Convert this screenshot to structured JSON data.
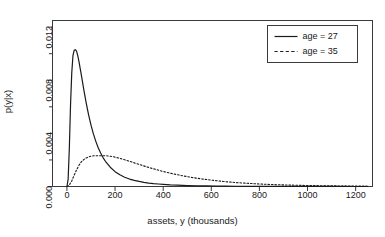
{
  "chart_data": {
    "type": "line",
    "title": "",
    "xlabel": "assets, y (thousands)",
    "ylabel": "p(y|x)",
    "xlim": [
      -60,
      1270
    ],
    "ylim": [
      0.0,
      0.0125
    ],
    "grid": false,
    "legend_position": "top-right",
    "xticks": [
      0,
      200,
      400,
      600,
      800,
      1000,
      1200
    ],
    "xtick_labels": [
      "0",
      "200",
      "400",
      "600",
      "800",
      "1000",
      "1200"
    ],
    "yticks": [
      0.0,
      0.004,
      0.008,
      0.012
    ],
    "ytick_labels": [
      "0.000",
      "0.004",
      "0.008",
      "0.012"
    ],
    "yminor_ticks": [
      0.002,
      0.006,
      0.01
    ],
    "series": [
      {
        "name": "age = 27",
        "style": "solid",
        "color": "#1a1a1a",
        "peak_x": 40,
        "peak_y": 0.0103,
        "x": [
          0,
          5,
          10,
          15,
          20,
          25,
          30,
          35,
          40,
          45,
          50,
          60,
          70,
          80,
          90,
          100,
          110,
          120,
          130,
          140,
          150,
          160,
          180,
          200,
          220,
          240,
          260,
          280,
          300,
          320,
          340,
          360,
          380,
          400,
          430,
          460,
          500,
          540,
          580,
          620,
          660,
          700,
          750,
          800,
          850,
          900,
          950,
          1000,
          1050,
          1100,
          1150,
          1200,
          1250
        ],
        "y": [
          0.0,
          0.00055,
          0.0029,
          0.0062,
          0.00855,
          0.00985,
          0.01025,
          0.0103,
          0.0102,
          0.00985,
          0.0094,
          0.00838,
          0.0073,
          0.0063,
          0.0054,
          0.00462,
          0.00396,
          0.0034,
          0.00292,
          0.00252,
          0.00218,
          0.0019,
          0.00145,
          0.00112,
          0.00088,
          0.0007,
          0.00056,
          0.00046,
          0.00038,
          0.00031,
          0.00026,
          0.00022,
          0.00019,
          0.00016,
          0.00012,
          0.0001,
          7e-05,
          5e-05,
          4e-05,
          3e-05,
          2.3e-05,
          1.8e-05,
          1.3e-05,
          1e-05,
          8e-06,
          6e-06,
          5e-06,
          4e-06,
          3e-06,
          2.5e-06,
          2e-06,
          1.5e-06,
          1e-06
        ]
      },
      {
        "name": "age = 35",
        "style": "dashed",
        "color": "#1a1a1a",
        "peak_x": 165,
        "peak_y": 0.00232,
        "x": [
          0,
          10,
          20,
          30,
          40,
          50,
          60,
          70,
          80,
          90,
          100,
          110,
          120,
          130,
          140,
          150,
          160,
          170,
          180,
          190,
          200,
          220,
          240,
          260,
          280,
          300,
          330,
          360,
          400,
          440,
          480,
          520,
          560,
          600,
          650,
          700,
          750,
          800,
          850,
          900,
          950,
          1000,
          1050,
          1100,
          1150,
          1200,
          1250
        ],
        "y": [
          0.0,
          0.00012,
          0.00042,
          0.00085,
          0.00125,
          0.0016,
          0.00186,
          0.00203,
          0.00215,
          0.00223,
          0.00228,
          0.00231,
          0.00232,
          0.00232,
          0.00232,
          0.00232,
          0.00232,
          0.0023,
          0.00228,
          0.00225,
          0.00221,
          0.00212,
          0.00201,
          0.0019,
          0.00178,
          0.00166,
          0.00149,
          0.00133,
          0.00113,
          0.00096,
          0.00081,
          0.00068,
          0.00057,
          0.00048,
          0.00038,
          0.0003,
          0.00024,
          0.00019,
          0.00015,
          0.00012,
          9.5e-05,
          7.6e-05,
          6e-05,
          4.8e-05,
          3.8e-05,
          3e-05,
          2.4e-05
        ]
      }
    ],
    "legend": [
      {
        "label": "age = 27",
        "style": "solid"
      },
      {
        "label": "age = 35",
        "style": "dashed"
      }
    ]
  }
}
